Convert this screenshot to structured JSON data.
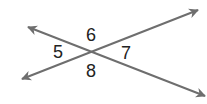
{
  "diagram": {
    "type": "intersecting-lines",
    "line_color": "#6e6e6e",
    "label_color": "#222222",
    "lines": [
      {
        "name": "line-a",
        "from": [
          22,
          79
        ],
        "to": [
          198,
          10
        ],
        "description": "rises from lower-left to upper-right"
      },
      {
        "name": "line-b",
        "from": [
          28,
          27
        ],
        "to": [
          205,
          96
        ],
        "description": "falls from upper-left to lower-right"
      }
    ],
    "intersection": [
      92,
      51
    ],
    "angles": [
      {
        "label": "5",
        "position": "left"
      },
      {
        "label": "6",
        "position": "top"
      },
      {
        "label": "7",
        "position": "right"
      },
      {
        "label": "8",
        "position": "bottom"
      }
    ]
  }
}
